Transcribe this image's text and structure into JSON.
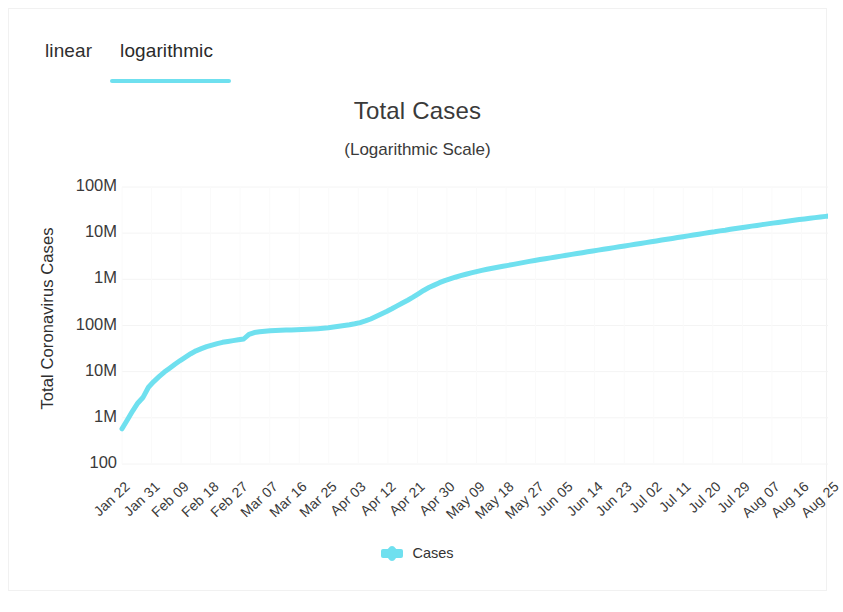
{
  "tabs": [
    {
      "label": "linear",
      "active": false,
      "name": "tab-linear"
    },
    {
      "label": "logarithmic",
      "active": true,
      "name": "tab-logarithmic"
    }
  ],
  "accent_color": "#6fe0ef",
  "chart_data": {
    "type": "line",
    "title": "Total Cases",
    "subtitle": "(Logarithmic Scale)",
    "xlabel": "",
    "ylabel": "Total Coronavirus Cases",
    "scale": "logarithmic",
    "grid": true,
    "legend_position": "bottom",
    "series": [
      {
        "name": "Cases",
        "color": "#6fe0ef",
        "values": [
          580,
          900,
          1400,
          2100,
          2800,
          4600,
          6100,
          7800,
          9800,
          11900,
          14500,
          17400,
          20600,
          24500,
          28300,
          31500,
          34900,
          37600,
          40600,
          43200,
          45200,
          47000,
          49100,
          51000,
          64400,
          70500,
          73300,
          75200,
          76800,
          78000,
          78900,
          79500,
          80300,
          81000,
          81800,
          82700,
          83800,
          85200,
          87100,
          89400,
          92800,
          96100,
          99500,
          103600,
          108800,
          115600,
          125600,
          138400,
          156800,
          177500,
          200600,
          230000,
          266000,
          306000,
          352000,
          410000,
          484000,
          574000,
          664000,
          748000,
          846000,
          936000,
          1020000,
          1110000,
          1200000,
          1290000,
          1380000,
          1470000,
          1560000,
          1650000,
          1740000,
          1830000,
          1920000,
          2010000,
          2110000,
          2220000,
          2330000,
          2450000,
          2560000,
          2680000,
          2800000,
          2920000,
          3050000,
          3180000,
          3320000,
          3470000,
          3620000,
          3780000,
          3940000,
          4110000,
          4290000,
          4470000,
          4660000,
          4860000,
          5060000,
          5280000,
          5500000,
          5740000,
          5980000,
          6240000,
          6510000,
          6790000,
          7080000,
          7390000,
          7700000,
          8030000,
          8380000,
          8740000,
          9110000,
          9500000,
          9910000,
          10300000,
          10700000,
          11200000,
          11600000,
          12100000,
          12600000,
          13100000,
          13600000,
          14200000,
          14700000,
          15300000,
          15900000,
          16500000,
          17100000,
          17700000,
          18400000,
          19000000,
          19700000,
          20300000,
          21000000,
          21700000,
          22400000,
          23100000,
          23800000
        ]
      }
    ],
    "y_ticks": [
      {
        "label": "100M",
        "value": 100000000
      },
      {
        "label": "10M",
        "value": 10000000
      },
      {
        "label": "1M",
        "value": 1000000
      },
      {
        "label": "100M",
        "value": 100000
      },
      {
        "label": "10M",
        "value": 10000
      },
      {
        "label": "1M",
        "value": 1000
      },
      {
        "label": "100",
        "value": 100
      }
    ],
    "x_ticks": [
      "Jan 22",
      "Jan 31",
      "Feb 09",
      "Feb 18",
      "Feb 27",
      "Mar 07",
      "Mar 16",
      "Mar 25",
      "Apr 03",
      "Apr 12",
      "Apr 21",
      "Apr 30",
      "May 09",
      "May 18",
      "May 27",
      "Jun 05",
      "Jun 14",
      "Jun 23",
      "Jul 02",
      "Jul 11",
      "Jul 20",
      "Jul 29",
      "Aug 07",
      "Aug 16",
      "Aug 25"
    ],
    "ylim": [
      100,
      100000000
    ],
    "legend": [
      {
        "label": "Cases",
        "color": "#6fe0ef"
      }
    ]
  }
}
